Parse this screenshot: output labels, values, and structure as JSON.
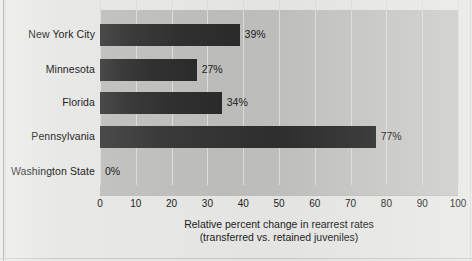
{
  "chart_data": {
    "type": "bar",
    "orientation": "horizontal",
    "title": "",
    "xlabel": "Relative percent change in rearrest rates",
    "xlabel_line2": "(transferred vs. retained juveniles)",
    "ylabel": "",
    "categories": [
      "New York City",
      "Minnesota",
      "Florida",
      "Pennsylvania",
      "Washington State"
    ],
    "values": [
      39,
      27,
      34,
      77,
      0
    ],
    "value_labels": [
      "39%",
      "27%",
      "34%",
      "77%",
      "0%"
    ],
    "xlim": [
      0,
      100
    ],
    "xticks": [
      0,
      10,
      20,
      30,
      40,
      50,
      60,
      70,
      80,
      90,
      100
    ],
    "xtick_labels": [
      "0",
      "10",
      "20",
      "30",
      "40",
      "50",
      "60",
      "70",
      "80",
      "90",
      "100"
    ],
    "grid": true,
    "grid_axis": "x",
    "legend": false,
    "legend_position": "none",
    "colors": {
      "bar_dark": "#2b2b2b",
      "bar_light": "#4a4a4a",
      "plot_background": "#c3c3c1",
      "figure_background": "#e8e8e6",
      "gridline": "#dedede",
      "text": "#1c1c1c"
    }
  }
}
